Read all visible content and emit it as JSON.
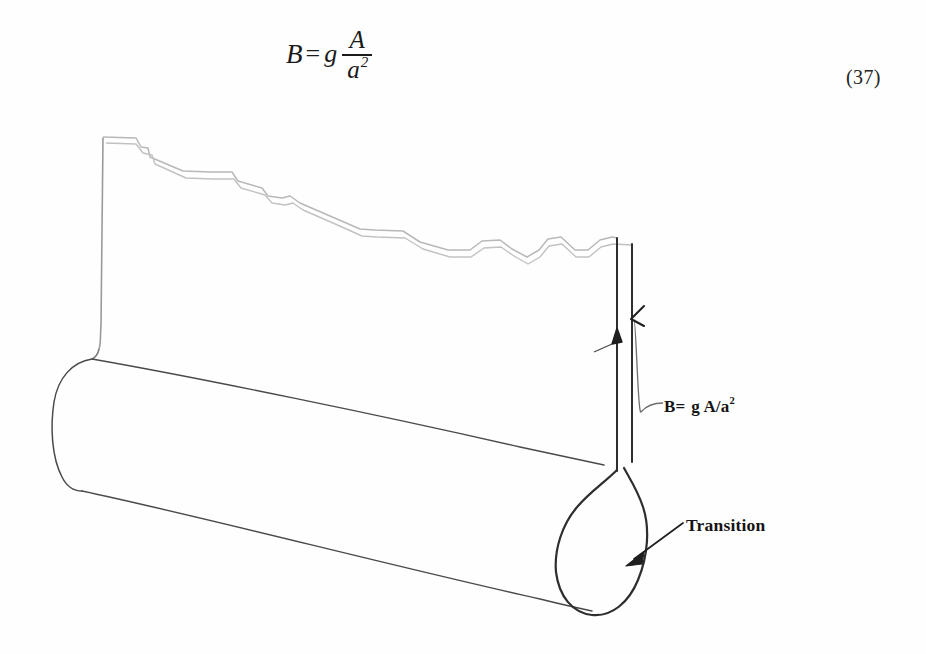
{
  "equation": {
    "lhs": "B",
    "equals": "=",
    "coefficient": "g",
    "numerator": "A",
    "denominator": "a",
    "denominator_exponent": "2",
    "number": "(37)",
    "plain_text": "B = g A/a^2"
  },
  "figure": {
    "labels": {
      "flux_symbol": "B",
      "flux_equals": "=",
      "flux_expression": " g A/a",
      "flux_exponent": "2",
      "flux_full": "B= g A/a2",
      "transition": "Transition"
    },
    "parts": {
      "cylinder": "flux-tube-cylinder",
      "neck": "narrow-flux-tube-neck",
      "bulb": "flux-tube-bulb",
      "jagged_top": "jagged-upper-boundary",
      "left_wall": "left-vertical-wall"
    },
    "colors": {
      "outline_dark": "#3a3a3a",
      "outline_light": "#b4b4b4",
      "background": "#ffffff",
      "text": "#141414"
    }
  }
}
